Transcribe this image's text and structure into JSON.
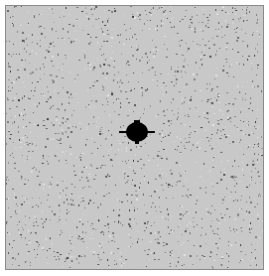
{
  "image": {
    "kind": "speckle-noise field with central dark object",
    "background_gray": "#c8c8c8",
    "frame_color": "#8a8a8a",
    "object": {
      "shape": "dark blob with horizontal spikes",
      "color": "#000000",
      "center": [
        137,
        132
      ],
      "body_size": [
        22,
        20
      ],
      "spike_extent_x": [
        119,
        155
      ]
    },
    "noise": {
      "density": 0.08,
      "dot_colors": [
        "#5a5a5a",
        "#7a7a7a",
        "#3a3a3a",
        "#e6e6e6"
      ]
    }
  }
}
